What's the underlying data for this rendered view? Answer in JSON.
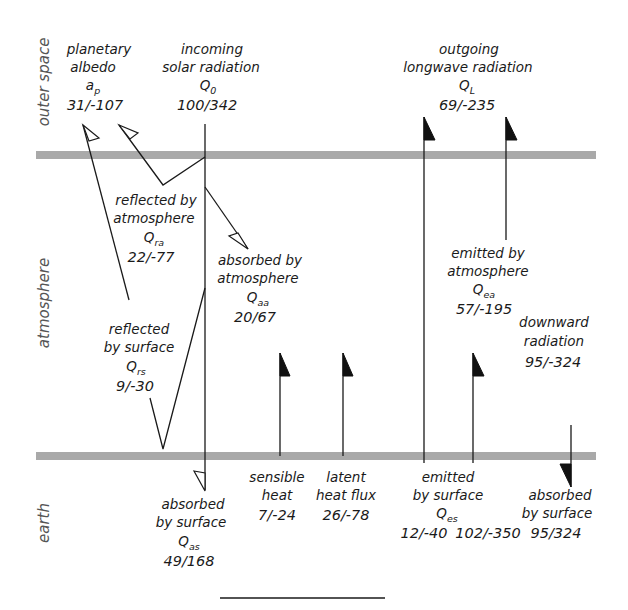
{
  "colors": {
    "band": "#a9a9a9",
    "line": "#1a1a1a",
    "zone_label": "#555555",
    "background": "#ffffff"
  },
  "zones": {
    "outer_space": "outer space",
    "atmosphere": "atmosphere",
    "earth": "earth"
  },
  "flows": {
    "planetary_albedo": {
      "line1": "planetary",
      "line2": "albedo",
      "symbol": "a",
      "symbol_sub": "p",
      "value": "31/-107"
    },
    "incoming_solar": {
      "line1": "incoming",
      "line2": "solar radiation",
      "symbol": "Q",
      "symbol_sub": "0",
      "value": "100/342"
    },
    "outgoing_longwave": {
      "line1": "outgoing",
      "line2": "longwave radiation",
      "symbol": "Q",
      "symbol_sub": "L",
      "value": "69/-235"
    },
    "reflected_by_atmosphere": {
      "line1": "reflected by",
      "line2": "atmosphere",
      "symbol": "Q",
      "symbol_sub": "ra",
      "value": "22/-77"
    },
    "absorbed_by_atmosphere": {
      "line1": "absorbed by",
      "line2": "atmosphere",
      "symbol": "Q",
      "symbol_sub": "aa",
      "value": "20/67"
    },
    "emitted_by_atmosphere": {
      "line1": "emitted by",
      "line2": "atmosphere",
      "symbol": "Q",
      "symbol_sub": "ea",
      "value": "57/-195"
    },
    "reflected_by_surface": {
      "line1": "reflected",
      "line2": "by surface",
      "symbol": "Q",
      "symbol_sub": "rs",
      "value": "9/-30"
    },
    "downward_radiation": {
      "line1": "downward",
      "line2": "radiation",
      "value": "95/-324"
    },
    "absorbed_by_surface_solar": {
      "line1": "absorbed",
      "line2": "by surface",
      "symbol": "Q",
      "symbol_sub": "as",
      "value": "49/168"
    },
    "sensible_heat": {
      "line1": "sensible",
      "line2": "heat",
      "value": "7/-24"
    },
    "latent_heat": {
      "line1": "latent",
      "line2": "heat flux",
      "value": "26/-78"
    },
    "emitted_by_surface": {
      "line1": "emitted",
      "line2": "by surface",
      "symbol": "Q",
      "symbol_sub": "es",
      "value_left": "12/-40",
      "value_right": "102/-350"
    },
    "absorbed_by_surface_longwave": {
      "line1": "absorbed",
      "line2": "by surface",
      "value": "95/324"
    }
  }
}
